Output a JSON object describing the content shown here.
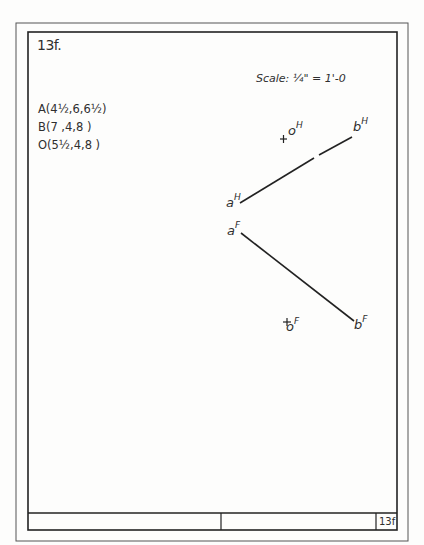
{
  "sheet": {
    "problem_id": "13f.",
    "title_block_number": "13f",
    "scale_label": "Scale: ¼\" = 1'-0"
  },
  "given_points": [
    {
      "name": "A",
      "text": "A(4½,6,6½)"
    },
    {
      "name": "B",
      "text": "B(7 ,4,8 )"
    },
    {
      "name": "O",
      "text": "O(5½,4,8 )"
    }
  ],
  "projections": {
    "horizontal": {
      "a": {
        "label": "a",
        "superscript": "H"
      },
      "b": {
        "label": "b",
        "superscript": "H"
      },
      "o": {
        "label": "o",
        "superscript": "H",
        "marker": "+"
      }
    },
    "frontal": {
      "a": {
        "label": "a",
        "superscript": "F"
      },
      "b": {
        "label": "b",
        "superscript": "F"
      },
      "o": {
        "label": "o",
        "superscript": "F",
        "marker": "+"
      }
    }
  },
  "colors": {
    "ink": "#2a2a2a",
    "paper": "#fdfdfc"
  }
}
